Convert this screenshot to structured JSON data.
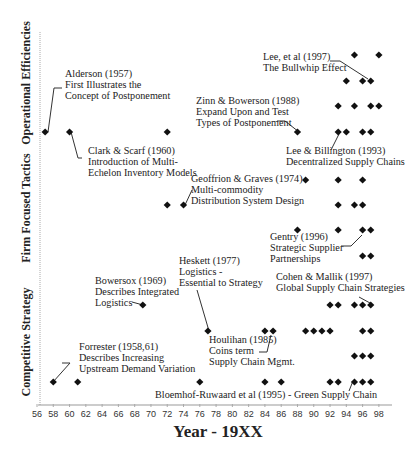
{
  "chart_data": {
    "type": "scatter",
    "title": "",
    "xlabel": "Year - 19XX",
    "ylabel": "",
    "xlim": [
      56,
      98
    ],
    "x_ticks": [
      "56",
      "58",
      "60",
      "62",
      "64",
      "66",
      "68",
      "70",
      "72",
      "74",
      "76",
      "78",
      "80",
      "82",
      "84",
      "86",
      "88",
      "90",
      "92",
      "94",
      "96",
      "98"
    ],
    "grid": false,
    "legend": null,
    "categories": [
      "Operational Efficiencies",
      "Firm Focused Tactics",
      "Competitive Strategy"
    ],
    "series": [
      {
        "name": "Operational Efficiencies",
        "rows": [
          {
            "y": 55,
            "years": [
              95,
              98
            ]
          },
          {
            "y": 81,
            "years": [
              94,
              96,
              97
            ]
          },
          {
            "y": 106,
            "years": [
              93,
              95,
              97,
              98
            ]
          },
          {
            "y": 132,
            "years": [
              57,
              60,
              72,
              88,
              93,
              94,
              96,
              97
            ]
          }
        ]
      },
      {
        "name": "Firm Focused Tactics",
        "rows": [
          {
            "y": 180,
            "years": [
              89,
              93,
              96
            ]
          },
          {
            "y": 205,
            "years": [
              72,
              74,
              93,
              95,
              96
            ]
          },
          {
            "y": 230,
            "years": [
              88,
              93,
              96,
              97
            ]
          },
          {
            "y": 256,
            "years": [
              96,
              97
            ]
          }
        ]
      },
      {
        "name": "Competitive Strategy",
        "rows": [
          {
            "y": 305,
            "years": [
              69,
              92,
              93,
              95,
              96,
              97
            ]
          },
          {
            "y": 331,
            "years": [
              77,
              84,
              85,
              89,
              90,
              91,
              92,
              96,
              97
            ]
          },
          {
            "y": 356,
            "years": [
              95,
              96,
              97
            ]
          },
          {
            "y": 382,
            "years": [
              58,
              61,
              76,
              84,
              86,
              92,
              93,
              95,
              96,
              97
            ]
          }
        ]
      }
    ],
    "annotations": [
      {
        "lines": [
          "Alderson (1957)",
          "First Illustrates the",
          "Concept of Postponement"
        ],
        "year": 57
      },
      {
        "lines": [
          "Clark & Scarf (1960)",
          "Introduction of Multi-",
          "Echelon Inventory Models"
        ],
        "year": 60
      },
      {
        "lines": [
          "Zinn & Bowerson (1988)",
          "Expand Upon and Test",
          "Types of Postponement"
        ],
        "year": 88
      },
      {
        "lines": [
          "Lee, et al (1997)",
          "The Bullwhip Effect"
        ],
        "year": 97
      },
      {
        "lines": [
          "Lee & Billington (1993)",
          "Decentralized Supply Chains"
        ],
        "year": 93
      },
      {
        "lines": [
          "Geoffrion & Graves (1974)",
          "Multi-commodity",
          "Distribution System Design"
        ],
        "year": 74
      },
      {
        "lines": [
          "Gentry (1996)",
          "Strategic Supplier",
          "Partnerships"
        ],
        "year": 96
      },
      {
        "lines": [
          "Bowersox (1969)",
          "Describes Integrated",
          "Logistics"
        ],
        "year": 69
      },
      {
        "lines": [
          "Heskett (1977)",
          "Logistics -",
          "Essential to Strategy"
        ],
        "year": 77
      },
      {
        "lines": [
          "Cohen & Mallik (1997)",
          "Global Supply Chain Strategies"
        ],
        "year": 97
      },
      {
        "lines": [
          "Houlihan (1985)",
          "Coins term",
          "Supply Chain Mgmt."
        ],
        "year": 85
      },
      {
        "lines": [
          "Forrester (1958,61)",
          "Describes Increasing",
          "Upstream Demand Variation"
        ],
        "year": 58
      },
      {
        "lines": [
          "Bloemhof-Ruwaard et al (1995) - Green Supply Chain"
        ],
        "year": 95
      }
    ]
  },
  "labels": {
    "x_title": "Year - 19XX",
    "y_sections": [
      "Operational Efficiencies",
      "Firm Focused Tactics",
      "Competitive Strategy"
    ]
  },
  "colors": {
    "marker": "#111111",
    "axis": "#999999",
    "text": "#222222"
  }
}
